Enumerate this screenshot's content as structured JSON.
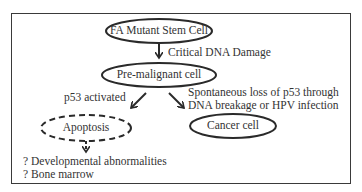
{
  "nodes": {
    "stem_cell": "FA Mutant Stem Cell",
    "premalignant": "Pre-malignant cell",
    "apoptosis": "Apoptosis",
    "cancer": "Cancer cell"
  },
  "edges": {
    "critical_damage": "Critical DNA Damage",
    "p53_activated": "p53 activated",
    "loss_line1": "Spontaneous loss of p53 through",
    "loss_line2": "DNA breakage or HPV infection"
  },
  "outcomes": {
    "developmental": "? Developmental abnormalities",
    "bone_marrow": "? Bone marrow"
  }
}
